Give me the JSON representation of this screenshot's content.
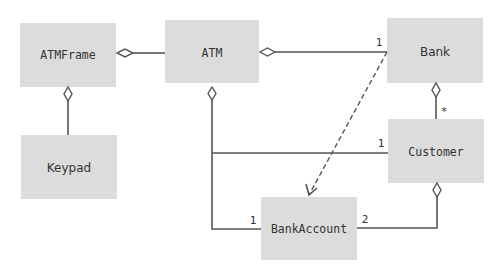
{
  "diagram": {
    "type": "UML class diagram",
    "classes": {
      "atmframe": "ATMFrame",
      "atm": "ATM",
      "bank": "Bank",
      "keypad": "Keypad",
      "customer": "Customer",
      "bankaccount": "BankAccount"
    },
    "multiplicities": {
      "atm_bank": "1",
      "bank_customer": "*",
      "atm_customer": "1",
      "atm_bankaccount": "1",
      "customer_bankaccount": "2"
    },
    "relationships": [
      {
        "from": "ATMFrame",
        "to": "ATM",
        "kind": "aggregation"
      },
      {
        "from": "ATMFrame",
        "to": "Keypad",
        "kind": "aggregation"
      },
      {
        "from": "ATM",
        "to": "Bank",
        "kind": "aggregation"
      },
      {
        "from": "ATM",
        "to": "Customer",
        "kind": "aggregation"
      },
      {
        "from": "ATM",
        "to": "BankAccount",
        "kind": "aggregation"
      },
      {
        "from": "Bank",
        "to": "Customer",
        "kind": "aggregation"
      },
      {
        "from": "Customer",
        "to": "BankAccount",
        "kind": "aggregation"
      },
      {
        "from": "Bank",
        "to": "BankAccount",
        "kind": "dependency"
      }
    ],
    "colors": {
      "box_fill": "#dcdcdc",
      "line": "#555555",
      "text": "#333333"
    }
  }
}
